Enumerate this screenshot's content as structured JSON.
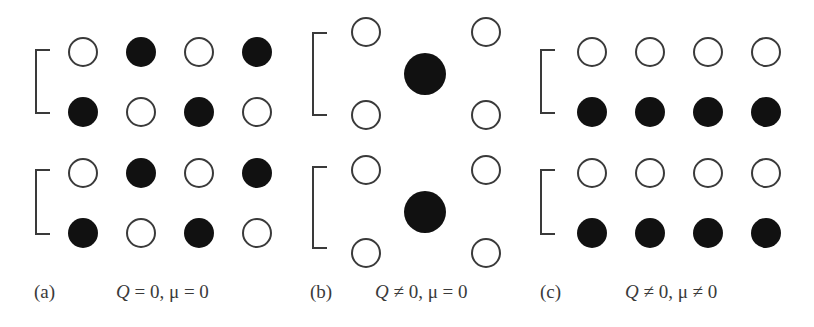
{
  "figure": {
    "colors": {
      "filled": "#111111",
      "stroke": "#3a3a3a",
      "background": "#ffffff"
    },
    "panels": [
      {
        "id": "a",
        "label": "(a)",
        "condition": "Q = 0, μ = 0",
        "condition_q": "Q",
        "condition_rest": " = 0, μ = 0",
        "layout": "grid",
        "columns_x": [
          83,
          141,
          199,
          257
        ],
        "rows_y": [
          52,
          112,
          173,
          233
        ],
        "radius": 15,
        "pattern": [
          [
            "open",
            "filled",
            "open",
            "filled"
          ],
          [
            "filled",
            "open",
            "filled",
            "open"
          ],
          [
            "open",
            "filled",
            "open",
            "filled"
          ],
          [
            "filled",
            "open",
            "filled",
            "open"
          ]
        ],
        "brackets": [
          {
            "x": 36,
            "top": 50,
            "bottom": 113
          },
          {
            "x": 36,
            "top": 170,
            "bottom": 234
          }
        ]
      },
      {
        "id": "b",
        "label": "(b)",
        "condition": "Q ≠ 0, μ = 0",
        "condition_q": "Q",
        "condition_rest": " ≠ 0, μ = 0",
        "layout": "cells",
        "small_circles": [
          {
            "x": 366,
            "y": 32
          },
          {
            "x": 486,
            "y": 32
          },
          {
            "x": 366,
            "y": 115
          },
          {
            "x": 486,
            "y": 115
          },
          {
            "x": 366,
            "y": 170
          },
          {
            "x": 486,
            "y": 170
          },
          {
            "x": 366,
            "y": 253
          },
          {
            "x": 486,
            "y": 253
          }
        ],
        "small_radius": 15,
        "large_circles": [
          {
            "x": 425,
            "y": 74
          },
          {
            "x": 425,
            "y": 212
          }
        ],
        "large_radius": 21,
        "brackets": [
          {
            "x": 313,
            "top": 33,
            "bottom": 115
          },
          {
            "x": 313,
            "top": 167,
            "bottom": 248
          }
        ]
      },
      {
        "id": "c",
        "label": "(c)",
        "condition": "Q ≠ 0, μ ≠ 0",
        "condition_q": "Q",
        "condition_rest": " ≠ 0, μ ≠ 0",
        "layout": "grid",
        "columns_x": [
          592,
          650,
          708,
          766
        ],
        "rows_y": [
          52,
          112,
          173,
          233
        ],
        "radius": 15,
        "pattern": [
          [
            "open",
            "open",
            "open",
            "open"
          ],
          [
            "filled",
            "filled",
            "filled",
            "filled"
          ],
          [
            "open",
            "open",
            "open",
            "open"
          ],
          [
            "filled",
            "filled",
            "filled",
            "filled"
          ]
        ],
        "brackets": [
          {
            "x": 541,
            "top": 50,
            "bottom": 113
          },
          {
            "x": 541,
            "top": 170,
            "bottom": 234
          }
        ]
      }
    ]
  }
}
